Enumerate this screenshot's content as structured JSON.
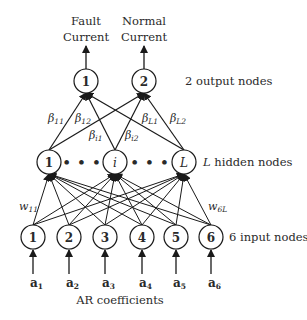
{
  "outputs": {
    "labels": [
      {
        "line1": "Fault",
        "line2": "Current"
      },
      {
        "line1": "Normal",
        "line2": "Current"
      }
    ],
    "nodes": [
      "1",
      "2"
    ],
    "layer_label": "2 output nodes"
  },
  "hidden": {
    "nodes": [
      "1",
      "i",
      "L"
    ],
    "ellipsis": "• • •",
    "layer_label_var": "L",
    "layer_label_text": " hidden nodes"
  },
  "inputs": {
    "nodes": [
      "1",
      "2",
      "3",
      "4",
      "5",
      "6"
    ],
    "layer_label": "6 input nodes",
    "coefficients": [
      {
        "base": "a",
        "sub": "1"
      },
      {
        "base": "a",
        "sub": "2"
      },
      {
        "base": "a",
        "sub": "3"
      },
      {
        "base": "a",
        "sub": "4"
      },
      {
        "base": "a",
        "sub": "5"
      },
      {
        "base": "a",
        "sub": "6"
      }
    ],
    "caption": "AR coefficients"
  },
  "weights": {
    "beta": [
      {
        "sym": "β",
        "sub": "11"
      },
      {
        "sym": "β",
        "sub": "12"
      },
      {
        "sym": "β",
        "sub": "i1"
      },
      {
        "sym": "β",
        "sub": "i2"
      },
      {
        "sym": "β",
        "sub": "L1"
      },
      {
        "sym": "β",
        "sub": "L2"
      }
    ],
    "w": [
      {
        "sym": "w",
        "sub": "11"
      },
      {
        "sym": "w",
        "sub": "6L"
      }
    ]
  },
  "colors": {
    "stroke": "#1a1a1a",
    "node_fill": "#ffffff",
    "text": "#2a2a2a"
  }
}
